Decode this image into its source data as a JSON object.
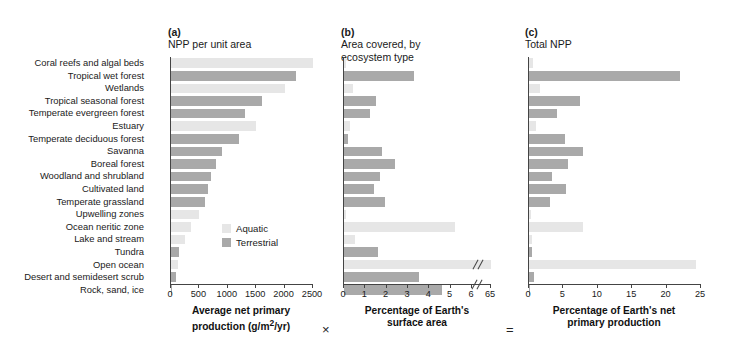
{
  "figure": {
    "operators": {
      "times": "×",
      "equals": "="
    }
  },
  "legend": {
    "position": "panel-a-inside-right",
    "items": [
      {
        "label": "Aquatic",
        "color": "#e6e6e6"
      },
      {
        "label": "Terrestrial",
        "color": "#a9a9a9"
      }
    ]
  },
  "chart_data": [
    {
      "type": "bar",
      "orientation": "horizontal",
      "panel": "a",
      "panel_tag": "(a)",
      "title": "NPP per unit area",
      "xlabel": "Average net primary\nproduction (g/m2/yr)",
      "xlabel_html": "Average net primary production (g/m²/yr)",
      "ylabel": "",
      "xlim": [
        0,
        2500
      ],
      "xticks": [
        0,
        500,
        1000,
        1500,
        2000,
        2500
      ],
      "grid": false,
      "categories": [
        "Coral reefs and algal beds",
        "Tropical wet forest",
        "Wetlands",
        "Tropical seasonal forest",
        "Temperate evergreen forest",
        "Estuary",
        "Temperate deciduous forest",
        "Savanna",
        "Boreal forest",
        "Woodland and shrubland",
        "Cultivated land",
        "Temperate grassland",
        "Upwelling zones",
        "Ocean neritic zone",
        "Lake and stream",
        "Tundra",
        "Open ocean",
        "Desert and semidesert scrub",
        "Rock, sand, ice"
      ],
      "group": [
        "aquatic",
        "terrestrial",
        "aquatic",
        "terrestrial",
        "terrestrial",
        "aquatic",
        "terrestrial",
        "terrestrial",
        "terrestrial",
        "terrestrial",
        "terrestrial",
        "terrestrial",
        "aquatic",
        "aquatic",
        "aquatic",
        "terrestrial",
        "aquatic",
        "terrestrial",
        "terrestrial"
      ],
      "values": [
        2500,
        2200,
        2000,
        1600,
        1300,
        1500,
        1200,
        900,
        800,
        700,
        650,
        600,
        500,
        360,
        250,
        140,
        125,
        90,
        3
      ]
    },
    {
      "type": "bar",
      "orientation": "horizontal",
      "panel": "b",
      "panel_tag": "(b)",
      "title": "Area covered, by\necosystem type",
      "xlabel": "Percentage of Earth's\nsurface area",
      "ylabel": "",
      "xlim": [
        0,
        6
      ],
      "xticks": [
        0,
        1,
        2,
        3,
        4,
        5,
        6
      ],
      "axis_break": {
        "after": 6,
        "resume_label": "65"
      },
      "grid": false,
      "categories": [
        "Coral reefs and algal beds",
        "Tropical wet forest",
        "Wetlands",
        "Tropical seasonal forest",
        "Temperate evergreen forest",
        "Estuary",
        "Temperate deciduous forest",
        "Savanna",
        "Boreal forest",
        "Woodland and shrubland",
        "Cultivated land",
        "Temperate grassland",
        "Upwelling zones",
        "Ocean neritic zone",
        "Lake and stream",
        "Tundra",
        "Open ocean",
        "Desert and semidesert scrub",
        "Rock, sand, ice"
      ],
      "group": [
        "aquatic",
        "terrestrial",
        "aquatic",
        "terrestrial",
        "terrestrial",
        "aquatic",
        "terrestrial",
        "terrestrial",
        "terrestrial",
        "terrestrial",
        "terrestrial",
        "terrestrial",
        "aquatic",
        "aquatic",
        "aquatic",
        "terrestrial",
        "aquatic",
        "terrestrial",
        "terrestrial"
      ],
      "values": [
        0.1,
        3.3,
        0.4,
        1.5,
        1.2,
        0.3,
        0.2,
        1.8,
        2.4,
        1.7,
        1.4,
        1.9,
        0.1,
        5.2,
        0.5,
        1.6,
        65,
        3.5,
        4.6
      ]
    },
    {
      "type": "bar",
      "orientation": "horizontal",
      "panel": "c",
      "panel_tag": "(c)",
      "title": "Total NPP",
      "xlabel": "Percentage of Earth's net\nprimary production",
      "ylabel": "",
      "xlim": [
        0,
        25
      ],
      "xticks": [
        0,
        5,
        10,
        15,
        20,
        25
      ],
      "grid": false,
      "categories": [
        "Coral reefs and algal beds",
        "Tropical wet forest",
        "Wetlands",
        "Tropical seasonal forest",
        "Temperate evergreen forest",
        "Estuary",
        "Temperate deciduous forest",
        "Savanna",
        "Boreal forest",
        "Woodland and shrubland",
        "Cultivated land",
        "Temperate grassland",
        "Upwelling zones",
        "Ocean neritic zone",
        "Lake and stream",
        "Tundra",
        "Open ocean",
        "Desert and semidesert scrub",
        "Rock, sand, ice"
      ],
      "group": [
        "aquatic",
        "terrestrial",
        "aquatic",
        "terrestrial",
        "terrestrial",
        "aquatic",
        "terrestrial",
        "terrestrial",
        "terrestrial",
        "terrestrial",
        "terrestrial",
        "terrestrial",
        "aquatic",
        "aquatic",
        "aquatic",
        "terrestrial",
        "aquatic",
        "terrestrial",
        "terrestrial"
      ],
      "values": [
        0.6,
        22.0,
        1.6,
        7.4,
        4.0,
        1.0,
        5.2,
        7.8,
        5.7,
        3.3,
        5.4,
        3.0,
        0.3,
        7.9,
        0.5,
        0.5,
        24.3,
        0.7,
        0.2
      ]
    }
  ]
}
